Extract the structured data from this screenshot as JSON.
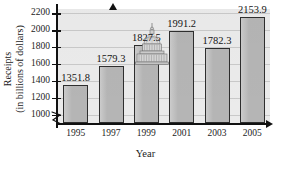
{
  "chart_data": {
    "type": "bar",
    "title": "",
    "xlabel": "Year",
    "ylabel_line1": "Receipts",
    "ylabel_line2": "(in billions of dollars)",
    "categories": [
      "1995",
      "1997",
      "1999",
      "2001",
      "2003",
      "2005"
    ],
    "values": [
      1351.8,
      1579.3,
      1827.5,
      1991.2,
      1782.3,
      2153.9
    ],
    "value_labels": [
      "1351.8",
      "1579.3",
      "1827.5",
      "1991.2",
      "1782.3",
      "2153.9"
    ],
    "ylim": [
      900,
      2250
    ],
    "ytick_labels": [
      "1000",
      "1200",
      "1400",
      "1600",
      "1800",
      "2000",
      "2200"
    ],
    "ytick_values": [
      1000,
      1200,
      1400,
      1600,
      1800,
      2000,
      2200
    ],
    "grid": true,
    "legend": "none",
    "axis_break": "y-axis break below 1000",
    "colors": {
      "bar_fill": "#b5b5b5",
      "bar_edge": "#2e2e2e",
      "plot_background": "#ebebeb",
      "gridline": "#c9c9c9",
      "axis": "#111111",
      "text": "#1c1c1c"
    },
    "decoration": "us-capitol-dome-illustration"
  }
}
